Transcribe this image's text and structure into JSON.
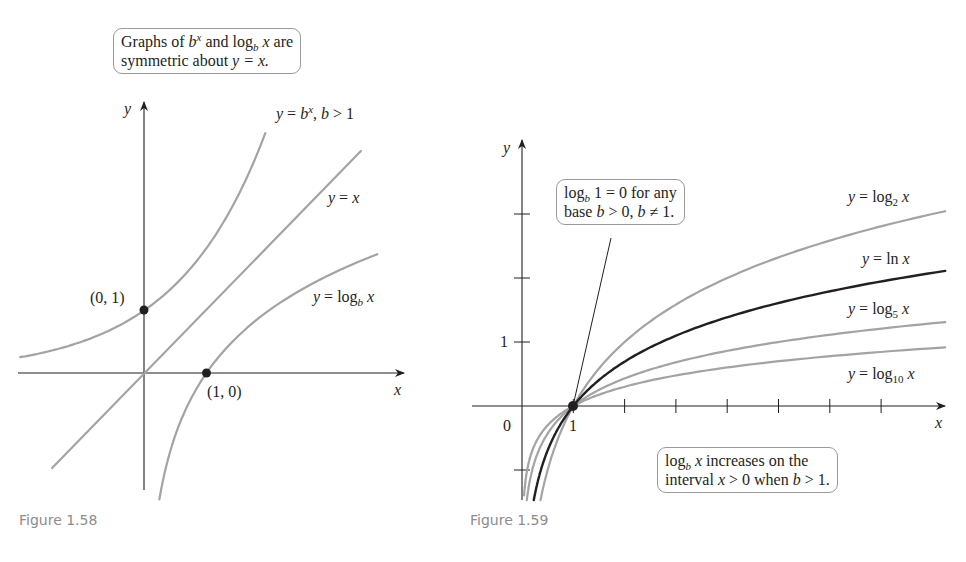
{
  "figures": [
    {
      "caption": "Figure 1.58",
      "callout": {
        "line1_a": "Graphs of ",
        "line1_b": "b",
        "line1_sup": "x",
        "line1_c": " and log",
        "line1_sub": "b",
        "line1_d": " x",
        "line1_e": " are",
        "line2_a": "symmetric about ",
        "line2_b": "y = x."
      },
      "axis_labels": {
        "x": "x",
        "y": "y"
      },
      "curve_labels": {
        "exp": {
          "a": "y",
          "b": " = ",
          "c": "b",
          "sup": "x",
          "d": ", ",
          "e": "b",
          "f": " > 1"
        },
        "identity": {
          "a": "y",
          "b": " = ",
          "c": "x"
        },
        "log": {
          "a": "y",
          "b": " = log",
          "sub": "b",
          "c": " x"
        }
      },
      "points": [
        {
          "label": "(0, 1)",
          "x": 0,
          "y": 1
        },
        {
          "label": "(1, 0)",
          "x": 1,
          "y": 0
        }
      ]
    },
    {
      "caption": "Figure 1.59",
      "callout_top": {
        "a": "log",
        "sub": "b",
        "b": " 1 = 0 for any",
        "line2_a": "base ",
        "line2_b": "b",
        "line2_c": " > 0, ",
        "line2_d": "b",
        "line2_e": " ≠ 1."
      },
      "callout_bottom": {
        "a": "log",
        "sub": "b",
        "b": " x",
        "c": " increases on the",
        "line2_a": "interval ",
        "line2_b": "x",
        "line2_c": " > 0 when ",
        "line2_d": "b",
        "line2_e": " > 1."
      },
      "axis_labels": {
        "x": "x",
        "y": "y"
      },
      "tick_labels": {
        "origin": "0",
        "x1": "1",
        "y1": "1"
      },
      "curve_labels": {
        "log2": {
          "a": "y",
          "b": " = log",
          "sub": "2",
          "c": " x"
        },
        "ln": {
          "a": "y",
          "b": " = ln ",
          "c": "x"
        },
        "log5": {
          "a": "y",
          "b": " = log",
          "sub": "5",
          "c": " x"
        },
        "log10": {
          "a": "y",
          "b": " = log",
          "sub": "10",
          "c": " x"
        }
      }
    }
  ],
  "colors": {
    "curve_gray": "#a3a3a3",
    "curve_black": "#231f20",
    "axis": "#231f20",
    "caption": "#8c8c8c"
  },
  "chart_data": [
    {
      "type": "line",
      "title": "Graphs of b^x and log_b x are symmetric about y = x.",
      "xlabel": "x",
      "ylabel": "y",
      "grid": false,
      "xlim": [
        -2,
        4.1
      ],
      "ylim": [
        -1.9,
        4.2
      ],
      "series": [
        {
          "name": "y = b^x, b > 1",
          "color": "#a3a3a3",
          "x": [
            -2.0,
            -1.5,
            -1.0,
            -0.5,
            0,
            0.5,
            1.0,
            1.5,
            1.95
          ],
          "y": [
            0.25,
            0.35,
            0.5,
            0.71,
            1.0,
            1.41,
            2.0,
            2.83,
            3.86
          ]
        },
        {
          "name": "y = x",
          "color": "#a3a3a3",
          "x": [
            -1.45,
            3.4
          ],
          "y": [
            -1.5,
            3.5
          ]
        },
        {
          "name": "y = log_b x",
          "color": "#a3a3a3",
          "x": [
            0.26,
            0.35,
            0.5,
            0.71,
            1.0,
            1.41,
            2.0,
            2.83,
            3.86
          ],
          "y": [
            -1.95,
            -1.5,
            -1.0,
            -0.5,
            0,
            0.5,
            1.0,
            1.5,
            1.95
          ]
        }
      ],
      "points": [
        {
          "label": "(0, 1)",
          "x": 0,
          "y": 1
        },
        {
          "label": "(1, 0)",
          "x": 1,
          "y": 0
        }
      ]
    },
    {
      "type": "line",
      "title": "log_b 1 = 0 for any base b > 0, b ≠ 1.  log_b x increases on the interval x > 0 when b > 1.",
      "xlabel": "x",
      "ylabel": "y",
      "grid": false,
      "xlim": [
        -1,
        8.3
      ],
      "ylim": [
        -1.5,
        4.0
      ],
      "x_ticks": [
        1,
        2,
        3,
        4,
        5,
        6,
        7
      ],
      "x_tick_labels": [
        "1"
      ],
      "y_ticks": [
        -1,
        1,
        2,
        3
      ],
      "y_tick_labels": [
        "1"
      ],
      "series": [
        {
          "name": "y = log_2 x",
          "color": "#a3a3a3",
          "x": [
            0.25,
            0.5,
            1,
            2,
            3,
            4,
            5,
            6,
            7,
            8
          ],
          "y": [
            -2.0,
            -1.0,
            0,
            1.0,
            1.58,
            2.0,
            2.32,
            2.58,
            2.81,
            3.0
          ]
        },
        {
          "name": "y = ln x",
          "color": "#231f20",
          "x": [
            0.25,
            0.5,
            1,
            2,
            3,
            4,
            5,
            6,
            7,
            8
          ],
          "y": [
            -1.39,
            -0.69,
            0,
            0.69,
            1.1,
            1.39,
            1.61,
            1.79,
            1.95,
            2.08
          ]
        },
        {
          "name": "y = log_5 x",
          "color": "#a3a3a3",
          "x": [
            0.25,
            0.5,
            1,
            2,
            3,
            4,
            5,
            6,
            7,
            8
          ],
          "y": [
            -0.86,
            -0.43,
            0,
            0.43,
            0.68,
            0.86,
            1.0,
            1.11,
            1.21,
            1.29
          ]
        },
        {
          "name": "y = log_10 x",
          "color": "#a3a3a3",
          "x": [
            0.25,
            0.5,
            1,
            2,
            3,
            4,
            5,
            6,
            7,
            8
          ],
          "y": [
            -0.6,
            -0.3,
            0,
            0.3,
            0.48,
            0.6,
            0.7,
            0.78,
            0.85,
            0.9
          ]
        }
      ],
      "points": [
        {
          "label": "(1, 0)",
          "x": 1,
          "y": 0
        }
      ]
    }
  ]
}
